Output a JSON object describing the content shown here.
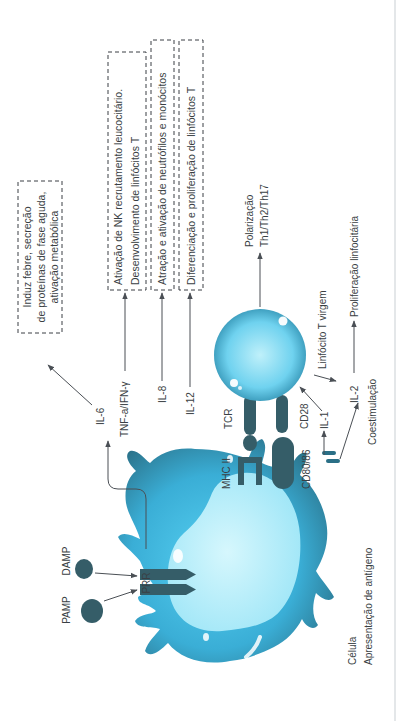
{
  "diagram": {
    "orientation": "rotated-90-ccw",
    "colors": {
      "cell_light": "#bff0fa",
      "cell_mid": "#46c4ec",
      "cell_dark": "#2a6f86",
      "receptor": "#355d68",
      "line": "#4a4f55",
      "text": "#3a3f44",
      "border": "#c9cfd3"
    },
    "apc": {
      "label_line1": "Célula",
      "label_line2": "Apresentação de antígeno"
    },
    "pathogen_signals": {
      "pamp": "PAMP",
      "damp": "DAMP",
      "prr": "PRR"
    },
    "synapse": {
      "mhc": "MHC II",
      "tcr": "TCR",
      "cd80": "CD80/86",
      "cd28": "CD28",
      "costim": "Coestimulação"
    },
    "cytokines": [
      {
        "name": "IL-6",
        "effect_lines": [
          "Induz febre, secreção",
          "de proteínas de fase aguda,",
          "ativação metabólica"
        ]
      },
      {
        "name": "TNF-a/IFN-γ",
        "effect_lines": [
          "Ativação de NK recrutamento leucocitário.",
          "Desenvolvimento de linfócitos T"
        ]
      },
      {
        "name": "IL-8",
        "effect_lines": [
          "Atração e ativação de neutrófilos e monócitos"
        ]
      },
      {
        "name": "IL-12",
        "effect_lines": [
          "Diferenciação e proliferação de linfócitos T"
        ]
      }
    ],
    "tcell": {
      "label": "Linfócito T virgem",
      "polarization_line1": "Polarização",
      "polarization_line2": "Th1/Th2/Th17"
    },
    "il1": "IL-1",
    "il2": "IL-2",
    "proliferation": "Proliferação linfocitária"
  }
}
